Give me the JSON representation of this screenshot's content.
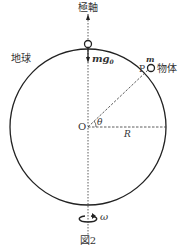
{
  "figure": {
    "caption": "図2",
    "axis_label": "極軸",
    "earth_label": "地球",
    "object_label": "物体",
    "mass_label": "m",
    "force_label": "mg",
    "force_subscript": "0",
    "point_label": "P",
    "center_label": "O",
    "angle_label": "θ",
    "radius_label": "R",
    "omega_label": "ω",
    "colors": {
      "line": "#222222",
      "text": "#333333"
    }
  }
}
